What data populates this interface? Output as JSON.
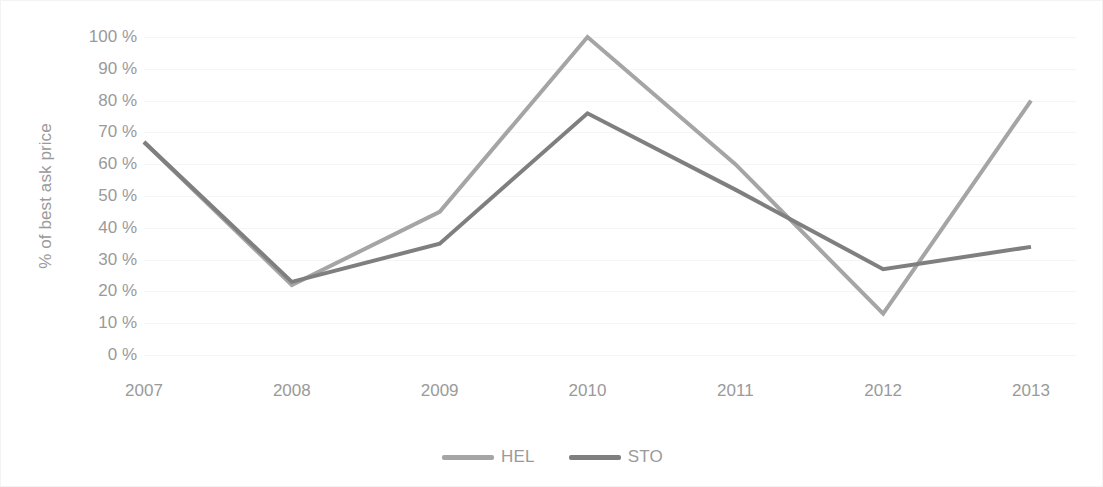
{
  "chart_data": {
    "type": "line",
    "title": "",
    "subtitle": "",
    "xlabel": "",
    "ylabel": "% of best ask price",
    "categories": [
      "2007",
      "2008",
      "2009",
      "2010",
      "2011",
      "2012",
      "2013"
    ],
    "x": [
      2007,
      2008,
      2009,
      2010,
      2011,
      2012,
      2013
    ],
    "series": [
      {
        "name": "HEL",
        "color": "#a5a5a5",
        "values": [
          67,
          22,
          45,
          100,
          60,
          13,
          80
        ]
      },
      {
        "name": "STO",
        "color": "#7f7f7f",
        "values": [
          67,
          23,
          35,
          76,
          52,
          27,
          34
        ]
      }
    ],
    "ylim": [
      0,
      100
    ],
    "ytick_values": [
      0,
      10,
      20,
      30,
      40,
      50,
      60,
      70,
      80,
      90,
      100
    ],
    "ytick_labels": [
      "0 %",
      "10 %",
      "20 %",
      "30 %",
      "40 %",
      "50 %",
      "60 %",
      "70 %",
      "80 %",
      "90 %",
      "100 %"
    ],
    "grid": true,
    "grid_axis": "y",
    "grid_color": "#f5f5f5",
    "legend_position": "bottom",
    "line_width": 4,
    "markers": false,
    "axis_text_color": "#9a9a9a",
    "background_color": "#ffffff",
    "border_color": "#f3f3f3"
  },
  "legend": {
    "entries": [
      {
        "label": "HEL",
        "color": "#a5a5a5"
      },
      {
        "label": "STO",
        "color": "#7f7f7f"
      }
    ]
  }
}
